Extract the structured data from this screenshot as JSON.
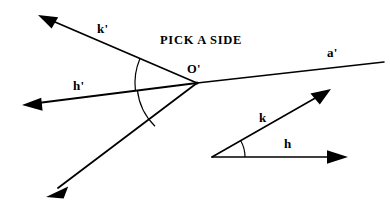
{
  "figure": {
    "title": "PICK A SIDE",
    "title_pos": {
      "x": 160,
      "y": 34
    },
    "stroke_color": "#000000",
    "background_color": "#ffffff",
    "canvas": {
      "width": 390,
      "height": 212
    },
    "left_diagram": {
      "name": "angle-h-prime-k-prime-at-O-prime",
      "vertex": {
        "x": 197,
        "y": 83,
        "label": "O'",
        "label_pos": {
          "x": 187,
          "y": 63
        }
      },
      "rays": [
        {
          "name": "ray-k-prime",
          "label": "k'",
          "label_pos": {
            "x": 97,
            "y": 22
          },
          "from": {
            "x": 197,
            "y": 83
          },
          "to": {
            "x": 38,
            "y": 15
          },
          "arrowhead": true
        },
        {
          "name": "ray-h-prime",
          "label": "h'",
          "label_pos": {
            "x": 73,
            "y": 79
          },
          "from": {
            "x": 197,
            "y": 83
          },
          "to": {
            "x": 22,
            "y": 105
          },
          "arrowhead": true
        },
        {
          "name": "ray-lower-left",
          "label": "",
          "from": {
            "x": 197,
            "y": 83
          },
          "to": {
            "x": 46,
            "y": 197
          },
          "arrowhead": true
        },
        {
          "name": "ray-a-prime",
          "label": "a'",
          "label_pos": {
            "x": 327,
            "y": 46
          },
          "from": {
            "x": 197,
            "y": 83
          },
          "to": {
            "x": 384,
            "y": 62
          },
          "arrowhead": false
        }
      ],
      "arcs": [
        {
          "name": "angle-arc-k-prime-to-h-prime",
          "center": {
            "x": 197,
            "y": 83
          },
          "radius": 62,
          "start_deg": 203,
          "end_deg": 173
        },
        {
          "name": "angle-arc-h-prime-to-lower-ray",
          "center": {
            "x": 197,
            "y": 83
          },
          "radius": 60,
          "start_deg": 173,
          "end_deg": 143
        }
      ]
    },
    "right_diagram": {
      "name": "angle-h-k",
      "vertex": {
        "x": 212,
        "y": 157
      },
      "rays": [
        {
          "name": "ray-k",
          "label": "k",
          "label_pos": {
            "x": 259,
            "y": 111
          },
          "from": {
            "x": 212,
            "y": 157
          },
          "to": {
            "x": 331,
            "y": 89
          },
          "arrowhead": true
        },
        {
          "name": "ray-h",
          "label": "h",
          "label_pos": {
            "x": 284,
            "y": 137
          },
          "from": {
            "x": 212,
            "y": 157
          },
          "to": {
            "x": 348,
            "y": 157
          },
          "arrowhead": true
        }
      ],
      "arcs": [
        {
          "name": "angle-arc-h-to-k",
          "center": {
            "x": 212,
            "y": 157
          },
          "radius": 33,
          "start_deg": 0,
          "end_deg": -30
        }
      ]
    }
  }
}
